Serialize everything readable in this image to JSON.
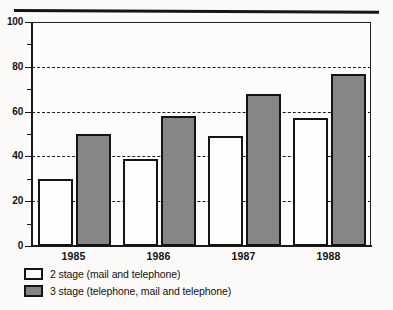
{
  "chart_data": {
    "type": "bar",
    "title": "",
    "subtitle": "",
    "xlabel": "",
    "ylabel": "",
    "categories": [
      "1985",
      "1986",
      "1987",
      "1988"
    ],
    "series": [
      {
        "name": "2 stage (mail and telephone)",
        "color": "#ffffff",
        "values": [
          30,
          39,
          49,
          57
        ]
      },
      {
        "name": "3 stage (telephone, mail and telephone)",
        "color": "#868686",
        "values": [
          50,
          58,
          68,
          77
        ]
      }
    ],
    "ylim": [
      0,
      100
    ],
    "y_major_ticks": [
      0,
      20,
      40,
      60,
      80,
      100
    ],
    "y_minor_ticks": [
      10,
      30,
      50,
      70,
      90
    ],
    "y_tick_labels": [
      "0",
      "20",
      "40",
      "60",
      "80",
      "100"
    ],
    "gridlines": {
      "on": true,
      "style": "dashed",
      "values": [
        20,
        40,
        60,
        80
      ]
    },
    "legend_position": "below-left",
    "legend": [
      {
        "label": "2 stage (mail and telephone)",
        "swatch": "white"
      },
      {
        "label": "3 stage (telephone, mail and telephone)",
        "swatch": "gray"
      }
    ]
  },
  "axis": {
    "y_labels": [
      "100",
      "80",
      "60",
      "40",
      "20",
      "0"
    ]
  },
  "colors": {
    "bar_white": "#fdfdfb",
    "bar_gray": "#868686",
    "ink": "#141414"
  }
}
